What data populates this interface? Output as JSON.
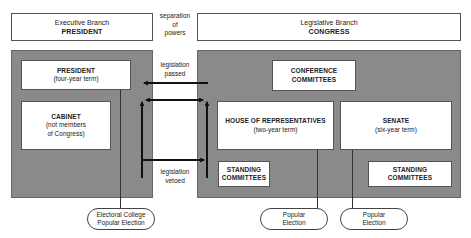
{
  "title_fragment": "",
  "headers": {
    "executive": {
      "line1": "Executive Branch",
      "line2": "PRESIDENT"
    },
    "legislative": {
      "line1": "Legislative Branch",
      "line2": "CONGRESS"
    }
  },
  "center_labels": {
    "separation": [
      "separation",
      "of",
      "powers"
    ],
    "passed": [
      "legislation",
      "passed"
    ],
    "vetoed": [
      "legislation",
      "vetoed"
    ]
  },
  "executive_panel": {
    "president": {
      "title": "PRESIDENT",
      "subtitle": "(four-year term)"
    },
    "cabinet": {
      "title": "CABINET",
      "line2": "(not members",
      "line3": "of Congress)"
    }
  },
  "legislative_panel": {
    "conference": {
      "line1": "CONFERENCE",
      "line2": "COMMITTEES"
    },
    "house": {
      "title": "HOUSE OF REPRESENTATIVES",
      "subtitle": "(two-year term)"
    },
    "senate": {
      "title": "SENATE",
      "subtitle": "(six-year term)"
    },
    "house_standing": {
      "line1": "STANDING",
      "line2": "COMMITTEES"
    },
    "senate_standing": {
      "line1": "STANDING",
      "line2": "COMMITTEES"
    }
  },
  "elections": {
    "president": {
      "line1": "Electoral College",
      "line2": "Popular Election"
    },
    "house": {
      "line1": "Popular",
      "line2": "Election"
    },
    "senate": {
      "line1": "Popular",
      "line2": "Election"
    }
  },
  "colors": {
    "panel": "#8a8a8a",
    "box": "#ffffff",
    "arrow": "#111111",
    "border": "#555555"
  }
}
